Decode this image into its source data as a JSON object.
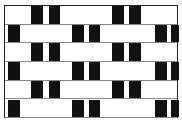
{
  "figure": {
    "colors": {
      "black_tile": "#111111",
      "white_tile": "#ffffff",
      "mortar": "#888888",
      "border": "#222222"
    },
    "rows": 6,
    "row_height": 18.7,
    "odd_row_black_tiles": [
      [
        26,
        12
      ],
      [
        44,
        11
      ],
      [
        107,
        12
      ],
      [
        124,
        12
      ]
    ],
    "even_row_black_tiles": [
      [
        3,
        12
      ],
      [
        67,
        12
      ],
      [
        84,
        11
      ],
      [
        150,
        12
      ],
      [
        166,
        8
      ]
    ]
  }
}
